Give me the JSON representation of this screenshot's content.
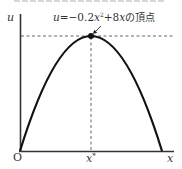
{
  "diagram": {
    "type": "parabola-graph",
    "axes": {
      "y_label": "u",
      "x_label": "x",
      "origin_label": "O"
    },
    "annotation": {
      "text": "u=−0.2x²+8xの頂点",
      "parts": {
        "u": "u",
        "eq": "=−0.2",
        "x1": "x",
        "sup": "2",
        "plus": "+8",
        "x2": "x",
        "suffix": "の頂点"
      }
    },
    "vertex_x_label": {
      "base": "x",
      "sup": "*"
    },
    "curve": {
      "equation": "u = -0.2x^2 + 8x",
      "x_intercepts": [
        0,
        40
      ],
      "vertex": [
        20,
        80
      ]
    },
    "colors": {
      "curve": "#111111",
      "axis": "#333333",
      "dashed": "#555555",
      "text": "#333333"
    }
  }
}
